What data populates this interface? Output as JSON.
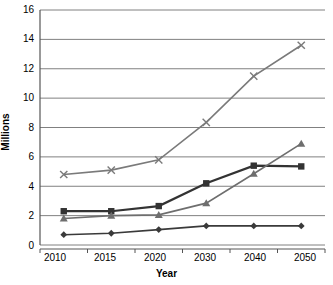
{
  "chart_data": {
    "type": "line",
    "title": "",
    "xlabel": "Year",
    "ylabel": "Millions",
    "categories": [
      "2010",
      "2015",
      "2020",
      "2030",
      "2040",
      "2050"
    ],
    "x": [
      2010,
      2015,
      2020,
      2030,
      2040,
      2050
    ],
    "ylim": [
      0,
      16
    ],
    "yticks": [
      0,
      2,
      4,
      6,
      8,
      10,
      12,
      14,
      16
    ],
    "ytick_labels": [
      "0",
      "2",
      "4",
      "6",
      "8",
      "10",
      "12",
      "14",
      "16"
    ],
    "grid": true,
    "legend": "none",
    "series": [
      {
        "name": "series-x-marker",
        "marker": "x",
        "color": "#7a7a7a",
        "values": [
          4.8,
          5.1,
          5.8,
          8.35,
          11.5,
          13.6
        ]
      },
      {
        "name": "series-square-marker",
        "marker": "square",
        "color": "#333333",
        "values": [
          2.3,
          2.3,
          2.65,
          4.2,
          5.4,
          5.35
        ]
      },
      {
        "name": "series-triangle-marker",
        "marker": "triangle",
        "color": "#6e6e6e",
        "values": [
          1.8,
          2.0,
          2.05,
          2.85,
          4.85,
          6.9
        ]
      },
      {
        "name": "series-diamond-marker",
        "marker": "diamond",
        "color": "#3a3a3a",
        "values": [
          0.7,
          0.8,
          1.05,
          1.3,
          1.3,
          1.3
        ]
      }
    ]
  },
  "axes": {
    "y_label": "Millions",
    "x_label": "Year",
    "y_tick_labels": [
      "16",
      "14",
      "12",
      "10",
      "8",
      "6",
      "4",
      "2",
      "0"
    ],
    "x_tick_labels": [
      "2010",
      "2015",
      "2020",
      "2030",
      "2040",
      "2050"
    ]
  },
  "colors": {
    "gridline": "#808080",
    "axis": "#555555",
    "background": "#ffffff"
  }
}
